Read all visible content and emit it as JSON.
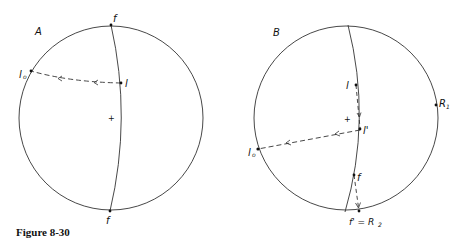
{
  "figure": {
    "caption": "Figure 8-30",
    "panels": [
      {
        "id": "A",
        "label": "A",
        "points": {
          "f_top": "f",
          "f_bottom": "f",
          "l": "l",
          "l0_main": "l",
          "l0_sub": "o",
          "center": "+"
        }
      },
      {
        "id": "B",
        "label": "B",
        "points": {
          "l": "l",
          "l_prime": "l'",
          "l0_main": "l",
          "l0_sub": "o",
          "R1_main": "R",
          "R1_sub": "1",
          "f": "f",
          "f_prime_R2_main": "f' = R",
          "f_prime_R2_sub": "2",
          "center": "+"
        }
      }
    ]
  },
  "colors": {
    "line": "#333333",
    "background": "#ffffff"
  }
}
